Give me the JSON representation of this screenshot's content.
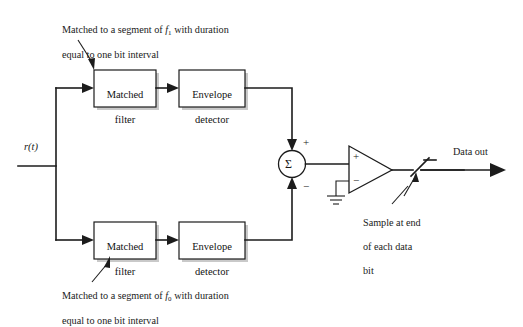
{
  "diagram": {
    "background_color": "#ffffff",
    "line_color": "#1c1c1c",
    "shadow_color": "#c9c9c9",
    "input_signal_label": "r(t)",
    "output_label": "Data out",
    "summing_node_symbol": "Σ",
    "summing_plus_sign": "+",
    "summing_minus_sign": "−",
    "opamp_plus_sign": "+",
    "opamp_minus_sign": "−",
    "blocks": [
      {
        "id": "matched-filter-top",
        "line1": "Matched",
        "line2": "filter"
      },
      {
        "id": "envelope-detector-top",
        "line1": "Envelope",
        "line2": "detector"
      },
      {
        "id": "matched-filter-bottom",
        "line1": "Matched",
        "line2": "filter"
      },
      {
        "id": "envelope-detector-bottom",
        "line1": "Envelope",
        "line2": "detector"
      }
    ],
    "annotations": {
      "top_caption_line1_pre": "Matched to a segment of ",
      "top_caption_subject": "f",
      "top_caption_subscript": "1",
      "top_caption_line1_post": " with duration",
      "top_caption_line2": "equal to one bit interval",
      "bottom_caption_line1_pre": "Matched to a segment of ",
      "bottom_caption_subject": "f",
      "bottom_caption_subscript": "0",
      "bottom_caption_line1_post": " with duration",
      "bottom_caption_line2": "equal to one bit interval",
      "sample_note_line1": "Sample at end",
      "sample_note_line2": "of each data",
      "sample_note_line3": "bit"
    }
  }
}
